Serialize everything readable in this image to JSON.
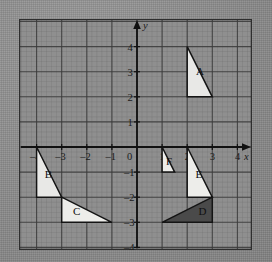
{
  "figure": {
    "type": "coordinate-grid-diagram",
    "background_color": "#8c8c8c",
    "grid": {
      "major_color": "#3a3a3a",
      "minor_color": "#6f6f6f",
      "border_color": "#2e2e2e",
      "minor_divisions_per_unit": 5,
      "x_range": [
        -4.6,
        4.6
      ],
      "y_range": [
        -4.6,
        4.6
      ]
    },
    "axes": {
      "x_axis_name": "x",
      "y_axis_name": "y",
      "origin_label": "0",
      "x_tick_labels": [
        "–4",
        "–3",
        "–2",
        "–1",
        "1",
        "2",
        "3",
        "4"
      ],
      "x_tick_values": [
        -4,
        -3,
        -2,
        -1,
        1,
        2,
        3,
        4
      ],
      "y_tick_labels": [
        "4",
        "3",
        "2",
        "1",
        "–1",
        "–2",
        "–3",
        "–4"
      ],
      "y_tick_values": [
        4,
        3,
        2,
        1,
        -1,
        -2,
        -3,
        -4
      ],
      "arrow_on_positive_x": true,
      "arrow_on_positive_y": true
    }
  },
  "chart_data": {
    "type": "scatter",
    "title": "",
    "xlabel": "x",
    "ylabel": "y",
    "xlim": [
      -4.6,
      4.6
    ],
    "ylim": [
      -4.6,
      4.6
    ],
    "grid": true,
    "legend": "none",
    "shapes": [
      {
        "label": "A",
        "kind": "right-triangle",
        "vertices": [
          [
            2,
            4
          ],
          [
            2,
            2
          ],
          [
            3,
            2
          ]
        ],
        "fill": "#e8e8e6",
        "stroke": "#141414",
        "label_position": [
          2.35,
          2.85
        ]
      },
      {
        "label": "B",
        "kind": "right-triangle",
        "vertices": [
          [
            -4,
            0
          ],
          [
            -4,
            -2
          ],
          [
            -3,
            -2
          ]
        ],
        "fill": "#e8e8e6",
        "stroke": "#141414",
        "label_position": [
          -3.68,
          -1.25
        ]
      },
      {
        "label": "C",
        "kind": "right-triangle",
        "vertices": [
          [
            -3,
            -2
          ],
          [
            -3,
            -3
          ],
          [
            -1,
            -3
          ]
        ],
        "fill": "#ededea",
        "stroke": "#141414",
        "label_position": [
          -2.55,
          -2.72
        ]
      },
      {
        "label": "D",
        "kind": "right-triangle",
        "vertices": [
          [
            1,
            -3
          ],
          [
            3,
            -3
          ],
          [
            3,
            -2
          ]
        ],
        "fill": "#4a4a4a",
        "stroke": "#141414",
        "label_position": [
          2.45,
          -2.7
        ]
      },
      {
        "label": "E",
        "kind": "right-triangle",
        "vertices": [
          [
            2,
            0
          ],
          [
            2,
            -2
          ],
          [
            3,
            -2
          ]
        ],
        "fill": "#ededea",
        "stroke": "#141414",
        "label_position": [
          2.33,
          -1.25
        ]
      },
      {
        "label": "F",
        "kind": "right-triangle",
        "vertices": [
          [
            1,
            0
          ],
          [
            1,
            -1
          ],
          [
            1.5,
            -1
          ]
        ],
        "fill": "#ededea",
        "stroke": "#141414",
        "label_position": [
          1.16,
          -0.72
        ]
      }
    ]
  }
}
